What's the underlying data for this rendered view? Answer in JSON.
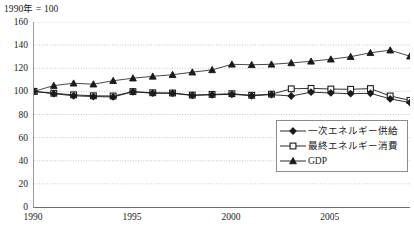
{
  "chart_data": {
    "type": "line",
    "title": "1990年 = 100",
    "xlabel": "",
    "ylabel": "",
    "ylim": [
      0,
      160
    ],
    "ytick_step": 20,
    "yticks": [
      "0",
      "20",
      "40",
      "60",
      "80",
      "100",
      "120",
      "140",
      "160"
    ],
    "xticks": [
      "1990",
      "1995",
      "2000",
      "2005"
    ],
    "xtick_years": [
      1990,
      1995,
      2000,
      2005
    ],
    "xlim": [
      1990,
      2009
    ],
    "grid": true,
    "grid_style": "dotted-horizontal",
    "legend_position": "inside-lower-right",
    "x": [
      1990,
      1991,
      1992,
      1993,
      1994,
      1995,
      1996,
      1997,
      1998,
      1999,
      2000,
      2001,
      2002,
      2003,
      2004,
      2005,
      2006,
      2007,
      2008,
      2009
    ],
    "series": [
      {
        "name": "一次エネルギー供給",
        "marker": "diamond",
        "color": "#1a1a1a",
        "values": [
          100.0,
          98.0,
          96.2,
          95.5,
          95.2,
          99.6,
          98.4,
          98.3,
          96.5,
          97.0,
          97.5,
          96.2,
          97.2,
          96.0,
          99.3,
          98.6,
          98.0,
          98.3,
          93.5,
          90.3
        ]
      },
      {
        "name": "最終エネルギー消費",
        "marker": "square-open",
        "color": "#1a1a1a",
        "values": [
          100.0,
          98.4,
          97.0,
          96.2,
          96.0,
          99.8,
          98.8,
          98.6,
          96.8,
          97.4,
          98.0,
          96.6,
          97.6,
          102.2,
          102.6,
          102.0,
          101.8,
          102.4,
          96.0,
          92.2
        ]
      },
      {
        "name": "GDP",
        "marker": "triangle",
        "color": "#1a1a1a",
        "values": [
          100.0,
          105.0,
          107.0,
          106.2,
          109.2,
          111.4,
          113.0,
          114.4,
          116.6,
          118.6,
          123.4,
          123.0,
          123.4,
          124.6,
          126.0,
          127.8,
          130.0,
          133.4,
          135.6,
          130.4
        ]
      }
    ]
  },
  "legend": {
    "items": [
      {
        "label": "一次エネルギー供給",
        "marker": "diamond"
      },
      {
        "label": "最終エネルギー消費",
        "marker": "square-open"
      },
      {
        "label": "GDP",
        "marker": "triangle"
      }
    ]
  }
}
